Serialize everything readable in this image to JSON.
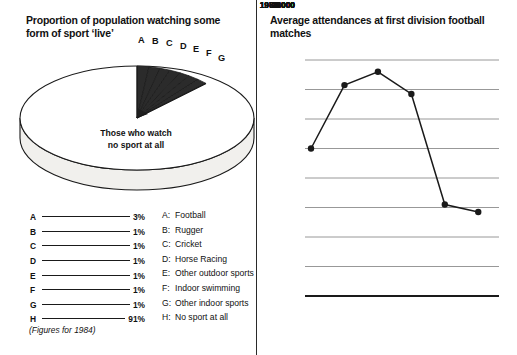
{
  "pie_panel": {
    "title": "Proportion of population watching some form of sport ‘live’",
    "center_label_line1": "Those who watch",
    "center_label_line2": "no sport at all",
    "footnote": "(Figures for 1984)",
    "wedge_labels": [
      "A",
      "B",
      "C",
      "D",
      "E",
      "F",
      "G"
    ],
    "percent_key": [
      {
        "key": "A",
        "value": "3%"
      },
      {
        "key": "B",
        "value": "1%"
      },
      {
        "key": "C",
        "value": "1%"
      },
      {
        "key": "D",
        "value": "1%"
      },
      {
        "key": "E",
        "value": "1%"
      },
      {
        "key": "F",
        "value": "1%"
      },
      {
        "key": "G",
        "value": "1%"
      },
      {
        "key": "H",
        "value": "91%"
      }
    ],
    "name_key": [
      {
        "key": "A:",
        "label": "Football"
      },
      {
        "key": "B:",
        "label": "Rugger"
      },
      {
        "key": "C:",
        "label": "Cricket"
      },
      {
        "key": "D:",
        "label": "Horse Racing"
      },
      {
        "key": "E:",
        "label": "Other outdoor sports"
      },
      {
        "key": "F:",
        "label": "Indoor swimming"
      },
      {
        "key": "G:",
        "label": "Other indoor sports"
      },
      {
        "key": "H:",
        "label": "No sport at all"
      }
    ]
  },
  "line_panel": {
    "title": "Average attendances at first division football matches"
  },
  "colors": {
    "ink": "#1a1a1a",
    "gridline": "#8c8c8c",
    "axis": "#1a1a1a",
    "pie_side": "#f1f0ed",
    "pie_top": "#ffffff",
    "wedge_fill": "#2b2b2b",
    "background": "#ffffff"
  },
  "chart_data": [
    {
      "type": "pie",
      "title": "Proportion of population watching some form of sport ‘live’",
      "labels": [
        "Football",
        "Rugger",
        "Cricket",
        "Horse Racing",
        "Other outdoor sports",
        "Indoor swimming",
        "Other indoor sports",
        "No sport at all"
      ],
      "keys": [
        "A",
        "B",
        "C",
        "D",
        "E",
        "F",
        "G",
        "H"
      ],
      "values": [
        3,
        1,
        1,
        1,
        1,
        1,
        1,
        91
      ],
      "unit": "%",
      "legend": "bottom",
      "annotation": "Those who watch no sport at all",
      "footnote": "(Figures for 1984)"
    },
    {
      "type": "line",
      "title": "Average attendances at first division football matches",
      "xlabel": "",
      "ylabel": "",
      "categories": [
        "1961",
        "1966",
        "1971",
        "1976",
        "1981",
        "1984"
      ],
      "values": [
        26000,
        30300,
        31200,
        29700,
        22200,
        21700
      ],
      "ylim": [
        16000,
        32000
      ],
      "yticks": [
        16000,
        18000,
        20000,
        22000,
        24000,
        26000,
        28000,
        30000,
        32000
      ],
      "grid": true,
      "legend": "none",
      "markers": true
    }
  ]
}
